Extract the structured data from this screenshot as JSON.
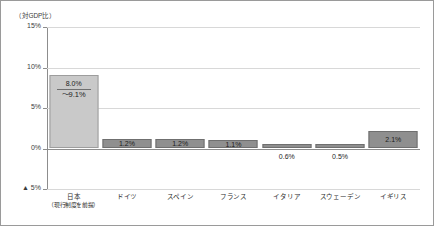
{
  "chart_data": {
    "type": "bar",
    "title": "",
    "subtitle": "",
    "unit_caption": "（対GDP比）",
    "xlabel": "",
    "ylabel": "",
    "ylim": [
      -5,
      15
    ],
    "grid": true,
    "legend": "none",
    "ytick_labels": [
      "15%",
      "10%",
      "5%",
      "0%",
      "▲ 5%"
    ],
    "ytick_values": [
      15,
      10,
      5,
      0,
      -5
    ],
    "categories": [
      "日本",
      "ドイツ",
      "スペイン",
      "フランス",
      "イタリア",
      "スウェーデン",
      "イギリス"
    ],
    "category_sublabels": [
      "（現行制度を前提）",
      "",
      "",
      "",
      "",
      "",
      ""
    ],
    "values": [
      9.1,
      1.2,
      1.2,
      1.1,
      0.6,
      0.5,
      2.1
    ],
    "data_labels": [
      "8.0%",
      "1.2%",
      "1.2%",
      "1.1%",
      "0.6%",
      "0.5%",
      "2.1%"
    ],
    "secondary_labels": [
      "～9.1%",
      "",
      "",
      "",
      "",
      "",
      ""
    ],
    "label_position": [
      "inside",
      "inside",
      "inside",
      "inside",
      "below",
      "below",
      "inside"
    ],
    "bar_styles": [
      "light",
      "dark",
      "dark",
      "dark",
      "dark",
      "dark",
      "dark"
    ],
    "colors": {
      "bar_light": "#c9c9c9",
      "bar_dark": "#8f8f8f",
      "gridline": "#d8d8d8",
      "axis": "#8d8d8d",
      "border": "#9a9a9a",
      "text": "#2c2c2c"
    }
  }
}
